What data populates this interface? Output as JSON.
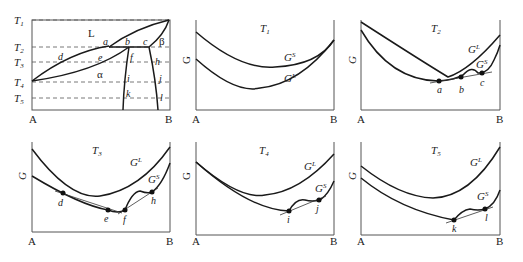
{
  "figure": {
    "phase_diagram": {
      "temperatures": [
        "T1",
        "T2",
        "T3",
        "T4",
        "T5"
      ],
      "axis": {
        "left": "A",
        "right": "B"
      },
      "regions": {
        "liquid": "L",
        "alpha": "α",
        "beta": "β"
      },
      "points": [
        "a",
        "b",
        "c",
        "d",
        "e",
        "f",
        "h",
        "i",
        "j",
        "k",
        "l"
      ]
    },
    "panels": [
      {
        "title": "T1",
        "ylabel": "G",
        "xleft": "A",
        "xright": "B",
        "curves": [
          "GS",
          "GL"
        ],
        "points": []
      },
      {
        "title": "T2",
        "ylabel": "G",
        "xleft": "A",
        "xright": "B",
        "curves": [
          "GL",
          "GS"
        ],
        "points": [
          "a",
          "b",
          "c"
        ]
      },
      {
        "title": "T3",
        "ylabel": "G",
        "xleft": "A",
        "xright": "B",
        "curves": [
          "GL",
          "GS"
        ],
        "points": [
          "d",
          "e",
          "f",
          "h"
        ]
      },
      {
        "title": "T4",
        "ylabel": "G",
        "xleft": "A",
        "xright": "B",
        "curves": [
          "GL",
          "GS"
        ],
        "points": [
          "i",
          "j"
        ]
      },
      {
        "title": "T5",
        "ylabel": "G",
        "xleft": "A",
        "xright": "B",
        "curves": [
          "GL",
          "GS"
        ],
        "points": [
          "k",
          "l"
        ]
      }
    ]
  },
  "labels": {
    "T": "T",
    "s1": "1",
    "s2": "2",
    "s3": "3",
    "s4": "4",
    "s5": "5",
    "A": "A",
    "B": "B",
    "G": "G",
    "L": "L",
    "alpha": "α",
    "beta": "β",
    "GG": "G",
    "supL": "L",
    "supS": "S",
    "a": "a",
    "b": "b",
    "c": "c",
    "d": "d",
    "e": "e",
    "f": "f",
    "h": "h",
    "i": "i",
    "j": "j",
    "k": "k",
    "l": "l"
  }
}
